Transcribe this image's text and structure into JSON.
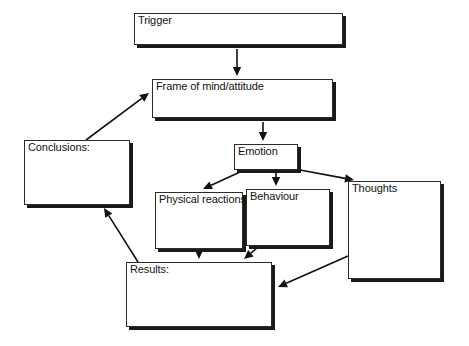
{
  "diagram": {
    "background_color": "#ffffff",
    "line_color": "#111111",
    "box_border_color": "#2b2b2b",
    "box_shadow_color": "#1a1a1a",
    "nodes": [
      {
        "id": "trigger",
        "label": "Trigger",
        "x": 134,
        "y": 13,
        "w": 209,
        "h": 32
      },
      {
        "id": "frame",
        "label": "Frame of mind/attitude",
        "x": 152,
        "y": 79,
        "w": 181,
        "h": 39
      },
      {
        "id": "emotion",
        "label": "Emotion",
        "x": 234,
        "y": 144,
        "w": 64,
        "h": 26
      },
      {
        "id": "physical",
        "label": "Physical reactions",
        "x": 155,
        "y": 192,
        "w": 88,
        "h": 57
      },
      {
        "id": "behaviour",
        "label": "Behaviour",
        "x": 246,
        "y": 189,
        "w": 84,
        "h": 57
      },
      {
        "id": "thoughts",
        "label": "Thoughts",
        "x": 348,
        "y": 181,
        "w": 93,
        "h": 98
      },
      {
        "id": "results",
        "label": "Results:",
        "x": 126,
        "y": 262,
        "w": 146,
        "h": 65
      },
      {
        "id": "conclusions",
        "label": "Conclusions:",
        "x": 24,
        "y": 140,
        "w": 106,
        "h": 65
      }
    ],
    "edges": [
      {
        "id": "trigger-to-frame",
        "from": "trigger",
        "to": "frame",
        "x1": 237,
        "y1": 49,
        "x2": 237,
        "y2": 76
      },
      {
        "id": "frame-to-emotion",
        "from": "frame",
        "to": "emotion",
        "x1": 263,
        "y1": 122,
        "x2": 263,
        "y2": 141
      },
      {
        "id": "emotion-to-physical",
        "from": "emotion",
        "to": "physical",
        "x1": 240,
        "y1": 172,
        "x2": 203,
        "y2": 189
      },
      {
        "id": "emotion-to-behaviour",
        "from": "emotion",
        "to": "behaviour",
        "x1": 276,
        "y1": 172,
        "x2": 276,
        "y2": 186
      },
      {
        "id": "emotion-to-thoughts",
        "from": "emotion",
        "to": "thoughts",
        "x1": 300,
        "y1": 170,
        "x2": 354,
        "y2": 180
      },
      {
        "id": "physical-to-results",
        "from": "physical",
        "to": "results",
        "x1": 199,
        "y1": 251,
        "x2": 199,
        "y2": 259
      },
      {
        "id": "behaviour-to-results",
        "from": "behaviour",
        "to": "results",
        "x1": 257,
        "y1": 248,
        "x2": 244,
        "y2": 259
      },
      {
        "id": "thoughts-to-results",
        "from": "thoughts",
        "to": "results",
        "x1": 348,
        "y1": 256,
        "x2": 278,
        "y2": 287
      },
      {
        "id": "results-to-conclusions",
        "from": "results",
        "to": "conclusions",
        "x1": 138,
        "y1": 262,
        "x2": 104,
        "y2": 208
      },
      {
        "id": "conclusions-to-frame",
        "from": "conclusions",
        "to": "frame",
        "x1": 86,
        "y1": 140,
        "x2": 149,
        "y2": 93
      }
    ]
  }
}
